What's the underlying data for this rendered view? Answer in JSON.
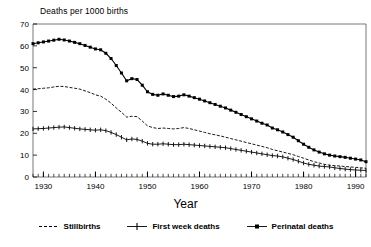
{
  "chart_data": {
    "type": "line",
    "title": "",
    "xlabel": "Year",
    "ylabel": "Deaths per 1000 births",
    "ylabel_position": "top-left-horizontal",
    "xlim": [
      1928,
      1992
    ],
    "ylim": [
      0,
      70
    ],
    "xticks": [
      1930,
      1940,
      1950,
      1960,
      1970,
      1980,
      1990
    ],
    "yticks": [
      0,
      10,
      20,
      30,
      40,
      50,
      60,
      70
    ],
    "minor_xticks_interval": 1,
    "grid": false,
    "legend_position": "bottom-center",
    "x": [
      1928,
      1929,
      1930,
      1931,
      1932,
      1933,
      1934,
      1935,
      1936,
      1937,
      1938,
      1939,
      1940,
      1941,
      1942,
      1943,
      1944,
      1945,
      1946,
      1947,
      1948,
      1949,
      1950,
      1951,
      1952,
      1953,
      1954,
      1955,
      1956,
      1957,
      1958,
      1959,
      1960,
      1961,
      1962,
      1963,
      1964,
      1965,
      1966,
      1967,
      1968,
      1969,
      1970,
      1971,
      1972,
      1973,
      1974,
      1975,
      1976,
      1977,
      1978,
      1979,
      1980,
      1981,
      1982,
      1983,
      1984,
      1985,
      1986,
      1987,
      1988,
      1989,
      1990,
      1991,
      1992
    ],
    "series": [
      {
        "name": "Perinatal deaths",
        "marker": "filled-square",
        "line_style": "solid",
        "color": "#000000",
        "values": [
          61.0,
          61.4,
          61.8,
          62.2,
          62.6,
          63.0,
          62.7,
          62.2,
          61.6,
          61.0,
          60.2,
          59.4,
          58.6,
          58.2,
          56.6,
          54.2,
          51.0,
          47.6,
          44.0,
          45.0,
          44.6,
          42.0,
          39.0,
          37.8,
          37.4,
          38.0,
          37.4,
          36.8,
          37.0,
          37.6,
          37.0,
          36.3,
          35.6,
          34.8,
          34.0,
          33.2,
          32.4,
          31.6,
          30.6,
          29.6,
          28.6,
          27.6,
          26.6,
          25.6,
          24.6,
          23.8,
          22.4,
          21.6,
          20.6,
          19.4,
          18.2,
          16.6,
          15.0,
          13.6,
          12.4,
          11.4,
          10.6,
          10.0,
          9.6,
          9.3,
          9.0,
          8.6,
          8.2,
          7.8,
          7.0
        ]
      },
      {
        "name": "Stillbirths",
        "marker": "none",
        "line_style": "dashed",
        "color": "#000000",
        "values": [
          40.2,
          40.4,
          40.6,
          40.8,
          41.2,
          41.5,
          41.4,
          41.0,
          40.6,
          40.2,
          39.4,
          38.6,
          37.6,
          37.0,
          35.6,
          33.8,
          31.6,
          29.6,
          27.4,
          27.8,
          27.6,
          25.6,
          23.4,
          22.6,
          22.2,
          22.4,
          22.2,
          22.0,
          22.2,
          22.6,
          22.2,
          21.6,
          21.0,
          20.4,
          19.8,
          19.3,
          18.8,
          18.2,
          17.6,
          17.0,
          16.4,
          15.8,
          15.2,
          14.6,
          14.0,
          13.4,
          12.6,
          12.0,
          11.4,
          10.8,
          10.2,
          9.4,
          8.6,
          7.8,
          7.0,
          6.4,
          5.8,
          5.4,
          5.2,
          5.0,
          4.8,
          4.6,
          4.4,
          4.2,
          4.0
        ]
      },
      {
        "name": "First week deaths",
        "marker": "plus",
        "line_style": "solid",
        "color": "#000000",
        "values": [
          22.0,
          22.1,
          22.2,
          22.4,
          22.6,
          22.8,
          22.9,
          22.6,
          22.3,
          22.0,
          21.8,
          21.6,
          21.4,
          21.6,
          21.2,
          20.4,
          19.4,
          18.2,
          17.0,
          17.4,
          17.2,
          16.4,
          15.4,
          15.0,
          15.0,
          15.2,
          15.0,
          14.8,
          14.8,
          15.0,
          14.8,
          14.6,
          14.4,
          14.2,
          14.0,
          13.8,
          13.6,
          13.4,
          13.0,
          12.6,
          12.2,
          11.8,
          11.4,
          11.0,
          10.6,
          10.2,
          9.8,
          9.6,
          9.2,
          8.6,
          8.0,
          7.2,
          6.4,
          5.8,
          5.4,
          5.0,
          4.8,
          4.6,
          4.2,
          3.9,
          3.6,
          3.4,
          3.2,
          3.1,
          3.0
        ]
      }
    ]
  },
  "legend": {
    "entries": [
      {
        "label": "Stillbirths",
        "marker": "dashed-line"
      },
      {
        "label": "First week deaths",
        "marker": "plus-marker"
      },
      {
        "label": "Perinatal deaths",
        "marker": "square-marker"
      }
    ]
  },
  "axis": {
    "y_title": "Deaths per 1000 births",
    "x_title": "Year"
  }
}
